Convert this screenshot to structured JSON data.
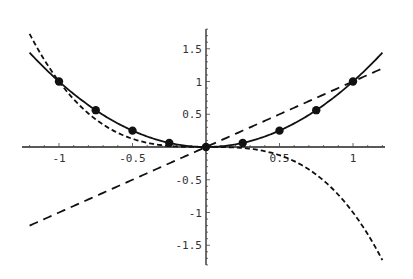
{
  "chart_data": {
    "type": "line",
    "title": "",
    "xlabel": "",
    "ylabel": "",
    "xlim": [
      -1.2,
      1.2
    ],
    "ylim": [
      -1.8,
      1.8
    ],
    "grid": false,
    "legend": null,
    "x_ticks": [
      {
        "value": -1,
        "label": "-1"
      },
      {
        "value": -0.5,
        "label": "-0.5"
      },
      {
        "value": 0.5,
        "label": "0.5"
      },
      {
        "value": 1,
        "label": "1"
      }
    ],
    "y_ticks": [
      {
        "value": 1.5,
        "label": "1.5"
      },
      {
        "value": 1,
        "label": "1"
      },
      {
        "value": 0.5,
        "label": "0.5"
      },
      {
        "value": -0.5,
        "label": "-0.5"
      },
      {
        "value": -1,
        "label": "-1"
      },
      {
        "value": -1.5,
        "label": "-1.5"
      }
    ],
    "series": [
      {
        "name": "solid curve (y = x^2)",
        "style": "solid",
        "function": "x^2",
        "x_range": [
          -1.2,
          1.2
        ]
      },
      {
        "name": "long-dashed line (y = x)",
        "style": "long-dash",
        "function": "x",
        "x_range": [
          -1.2,
          1.2
        ]
      },
      {
        "name": "short-dashed curve (y = -x^3)",
        "style": "short-dash",
        "function": "-x^3",
        "x_range": [
          -1.2,
          1.2
        ]
      },
      {
        "name": "data points",
        "style": "markers",
        "x": [
          -1,
          -0.75,
          -0.5,
          -0.25,
          0,
          0.25,
          0.5,
          0.75,
          1
        ],
        "y": [
          1,
          0.5625,
          0.25,
          0.0625,
          0,
          0.0625,
          0.25,
          0.5625,
          1
        ]
      }
    ]
  },
  "layout": {
    "origin_px": [
      206,
      147
    ],
    "x_scale_px": 147,
    "y_scale_px": 65.5,
    "y_axis_px": [
      29,
      265
    ],
    "x_axis_px": [
      22,
      385
    ]
  }
}
